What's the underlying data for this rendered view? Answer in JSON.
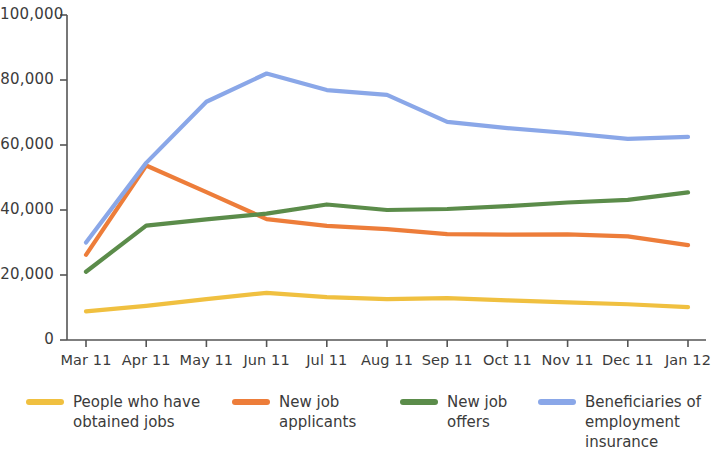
{
  "chart_data": {
    "type": "line",
    "title": "",
    "xlabel": "",
    "ylabel": "",
    "categories": [
      "Mar 11",
      "Apr 11",
      "May 11",
      "Jun 11",
      "Jul 11",
      "Aug 11",
      "Sep 11",
      "Oct 11",
      "Nov 11",
      "Dec 11",
      "Jan 12"
    ],
    "ylim": [
      0,
      100000
    ],
    "yticks": [
      0,
      20000,
      40000,
      60000,
      80000,
      100000
    ],
    "ytick_labels": [
      "0",
      "20,000",
      "40,000",
      "60,000",
      "80,000",
      "100,000"
    ],
    "grid": false,
    "legend_position": "bottom",
    "series": [
      {
        "name": "People who have obtained jobs",
        "legend_label": "People who have\nobtained jobs",
        "color": "#F0C040",
        "values": [
          8800,
          10500,
          12600,
          14500,
          13200,
          12600,
          12900,
          12200,
          11600,
          11000,
          10100
        ]
      },
      {
        "name": "New job applicants",
        "legend_label": "New job\napplicants",
        "color": "#ED7D3A",
        "values": [
          26200,
          53700,
          45500,
          37200,
          35100,
          34100,
          32600,
          32400,
          32500,
          31900,
          29200
        ]
      },
      {
        "name": "New job offers",
        "legend_label": "New job\noffers",
        "color": "#5B8C4A",
        "values": [
          21000,
          35200,
          37100,
          38900,
          41700,
          40000,
          40300,
          41200,
          42300,
          43100,
          45400
        ]
      },
      {
        "name": "Beneficiaries of employment insurance",
        "legend_label": "Beneficiaries of\nemployment\ninsurance",
        "color": "#8AA7E8",
        "values": [
          30000,
          54500,
          73300,
          82000,
          76900,
          75400,
          67100,
          65200,
          63700,
          61900,
          62500
        ]
      }
    ]
  },
  "axis": {
    "line_color": "#555555"
  }
}
